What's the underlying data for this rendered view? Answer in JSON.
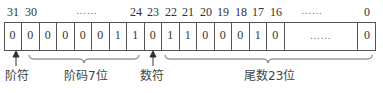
{
  "bit_numbers": {
    "b31": "31",
    "b30": "30",
    "dots1": "……",
    "b24": "24",
    "b23": "23",
    "b22": "22",
    "b21": "21",
    "b20": "20",
    "b19": "19",
    "b18": "18",
    "b17": "17",
    "b16": "16",
    "dots2": "……",
    "b0": "0"
  },
  "cells": [
    "0",
    "0",
    "0",
    "0",
    "0",
    "0",
    "1",
    "1",
    "0",
    "1",
    "1",
    "0",
    "0",
    "0",
    "1",
    "0"
  ],
  "cell_dots": "……",
  "last_cell": "0",
  "labels": {
    "exp_sign": "阶符",
    "exponent": "阶码7位",
    "mant_sign": "数符",
    "mantissa": "尾数23位"
  }
}
